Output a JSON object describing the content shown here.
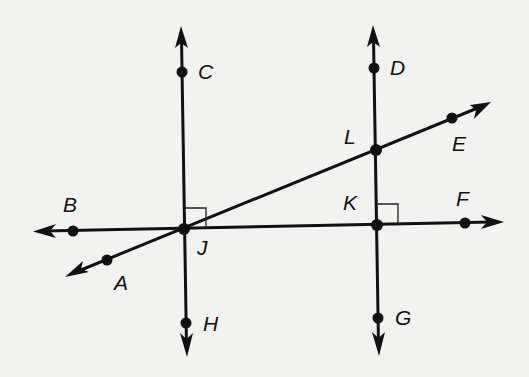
{
  "diagram": {
    "type": "geometry-lines",
    "colors": {
      "background": "#f2f2f0",
      "ink": "#111111"
    },
    "points": {
      "A": {
        "label": "A",
        "x": 107,
        "y": 260
      },
      "B": {
        "label": "B",
        "x": 73,
        "y": 231
      },
      "C": {
        "label": "C",
        "x": 182,
        "y": 72
      },
      "D": {
        "label": "D",
        "x": 374,
        "y": 68
      },
      "E": {
        "label": "E",
        "x": 452,
        "y": 118
      },
      "F": {
        "label": "F",
        "x": 465,
        "y": 223
      },
      "G": {
        "label": "G",
        "x": 378,
        "y": 318
      },
      "H": {
        "label": "H",
        "x": 186,
        "y": 323
      },
      "J": {
        "label": "J",
        "x": 184,
        "y": 229
      },
      "K": {
        "label": "K",
        "x": 377,
        "y": 225
      },
      "L": {
        "label": "L",
        "x": 376,
        "y": 150
      }
    },
    "lines": [
      {
        "name": "CH",
        "through": [
          "C",
          "J",
          "H"
        ],
        "arrows": "both"
      },
      {
        "name": "DG",
        "through": [
          "D",
          "L",
          "K",
          "G"
        ],
        "arrows": "both"
      },
      {
        "name": "BF",
        "through": [
          "B",
          "J",
          "K",
          "F"
        ],
        "arrows": "both"
      },
      {
        "name": "AE",
        "through": [
          "A",
          "J",
          "L",
          "E"
        ],
        "arrows": "both"
      }
    ],
    "right_angles": [
      {
        "at": "J",
        "between": [
          "C",
          "F"
        ]
      },
      {
        "at": "K",
        "between": [
          "D",
          "F"
        ]
      }
    ]
  }
}
